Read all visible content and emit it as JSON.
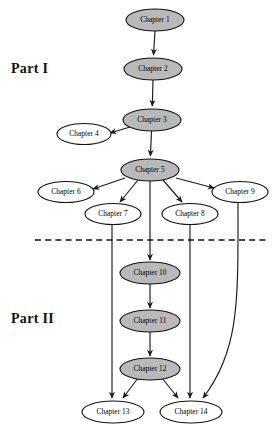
{
  "diagram": {
    "background_color": "#ffffff",
    "node_fill_highlight": "#b9b9b9",
    "node_fill_plain": "#ffffff",
    "node_stroke": "#111111",
    "edge_color": "#1a1a1a",
    "divider": {
      "name": "part-divider",
      "style": "dashed",
      "x1": 35,
      "x2": 266,
      "y": 240
    },
    "sections": [
      {
        "id": "part-1",
        "label": "Part I"
      },
      {
        "id": "part-2",
        "label": "Part II"
      }
    ],
    "nodes": [
      {
        "id": "ch1",
        "label": "Chapter 1",
        "cx": 155,
        "cy": 20,
        "rx": 29,
        "ry": 11,
        "fill": "highlight"
      },
      {
        "id": "ch2",
        "label": "Chapter 2",
        "cx": 153,
        "cy": 69,
        "rx": 29,
        "ry": 11,
        "fill": "highlight"
      },
      {
        "id": "ch3",
        "label": "Chapter 3",
        "cx": 152,
        "cy": 120,
        "rx": 29,
        "ry": 11,
        "fill": "highlight"
      },
      {
        "id": "ch4",
        "label": "Chapter 4",
        "cx": 84,
        "cy": 134,
        "rx": 27,
        "ry": 10.5,
        "fill": "plain"
      },
      {
        "id": "ch5",
        "label": "Chapter 5",
        "cx": 150,
        "cy": 170,
        "rx": 29,
        "ry": 11,
        "fill": "highlight"
      },
      {
        "id": "ch6",
        "label": "Chapter 6",
        "cx": 66,
        "cy": 192,
        "rx": 28,
        "ry": 10.5,
        "fill": "plain"
      },
      {
        "id": "ch7",
        "label": "Chapter 7",
        "cx": 113,
        "cy": 214,
        "rx": 28,
        "ry": 10.5,
        "fill": "plain"
      },
      {
        "id": "ch8",
        "label": "Chapter 8",
        "cx": 190,
        "cy": 214,
        "rx": 28,
        "ry": 10.5,
        "fill": "plain"
      },
      {
        "id": "ch9",
        "label": "Chapter 9",
        "cx": 240,
        "cy": 192,
        "rx": 28,
        "ry": 10.5,
        "fill": "plain"
      },
      {
        "id": "ch10",
        "label": "Chapter 10",
        "cx": 150,
        "cy": 273,
        "rx": 30,
        "ry": 11,
        "fill": "highlight"
      },
      {
        "id": "ch11",
        "label": "Chapter 11",
        "cx": 150,
        "cy": 321,
        "rx": 30,
        "ry": 11,
        "fill": "highlight"
      },
      {
        "id": "ch12",
        "label": "Chapter 12",
        "cx": 150,
        "cy": 369,
        "rx": 30,
        "ry": 11,
        "fill": "highlight"
      },
      {
        "id": "ch13",
        "label": "Chapter 13",
        "cx": 113,
        "cy": 412,
        "rx": 31,
        "ry": 11,
        "fill": "plain"
      },
      {
        "id": "ch14",
        "label": "Chapter 14",
        "cx": 191,
        "cy": 412,
        "rx": 31,
        "ry": 11,
        "fill": "plain"
      }
    ],
    "edges": [
      {
        "id": "e1",
        "from": "ch1",
        "to": "ch2",
        "path": "M 155 31 L 153.5 55"
      },
      {
        "id": "e2",
        "from": "ch2",
        "to": "ch3",
        "path": "M 153 80 L 152.3 106"
      },
      {
        "id": "e3",
        "from": "ch3",
        "to": "ch4",
        "path": "M 130 127 L 110 133"
      },
      {
        "id": "e4",
        "from": "ch3",
        "to": "ch5",
        "path": "M 151.5 131 L 150.4 156"
      },
      {
        "id": "e5",
        "from": "ch5",
        "to": "ch6",
        "path": "M 125 178 L 93 189"
      },
      {
        "id": "e6",
        "from": "ch5",
        "to": "ch7",
        "path": "M 138 180 L 120 202"
      },
      {
        "id": "e7",
        "from": "ch5",
        "to": "ch8",
        "path": "M 163 180 L 182 202"
      },
      {
        "id": "e8",
        "from": "ch5",
        "to": "ch9",
        "path": "M 176 178 L 214 188"
      },
      {
        "id": "e9",
        "from": "ch5",
        "to": "ch10",
        "path": "M 150 181 L 150 260"
      },
      {
        "id": "e10",
        "from": "ch7",
        "to": "ch13",
        "path": "M 112 225 L 112 398"
      },
      {
        "id": "e11",
        "from": "ch8",
        "to": "ch14",
        "path": "M 190 225 L 190 398"
      },
      {
        "id": "e12",
        "from": "ch9",
        "to": "ch14",
        "path": "M 238 203 C 238 300 240 350 203 398"
      },
      {
        "id": "e13",
        "from": "ch10",
        "to": "ch11",
        "path": "M 150 284 L 150 308"
      },
      {
        "id": "e14",
        "from": "ch11",
        "to": "ch12",
        "path": "M 150 332 L 150 356"
      },
      {
        "id": "e15",
        "from": "ch12",
        "to": "ch13",
        "path": "M 138 378 L 123 398"
      },
      {
        "id": "e16",
        "from": "ch12",
        "to": "ch14",
        "path": "M 162 378 L 178 398"
      }
    ]
  }
}
